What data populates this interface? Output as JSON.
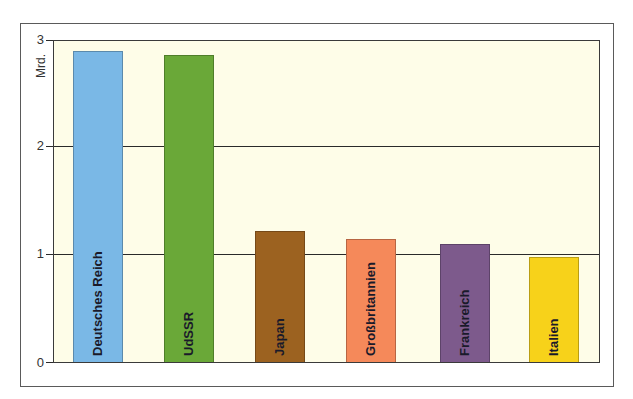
{
  "chart_data": {
    "type": "bar",
    "title": "",
    "xlabel": "",
    "ylabel": "Mrd.",
    "ylim": [
      0,
      3
    ],
    "yticks": [
      0,
      1,
      2,
      3
    ],
    "grid": true,
    "categories": [
      "Deutsches Reich",
      "UdSSR",
      "Japan",
      "Großbritannien",
      "Frankreich",
      "Italien"
    ],
    "values": [
      2.91,
      2.87,
      1.22,
      1.15,
      1.1,
      0.98
    ],
    "colors": [
      "#7ab8e6",
      "#6aa838",
      "#9c6220",
      "#f5895a",
      "#7d5a8c",
      "#f7d21a"
    ],
    "bar_label_position": "inside-vertical"
  },
  "axis": {
    "unit": "Mrd.",
    "ticks": [
      "0",
      "1",
      "2",
      "3"
    ]
  },
  "bars": [
    {
      "label": "Deutsches Reich",
      "value": 2.91,
      "color": "#7ab8e6"
    },
    {
      "label": "UdSSR",
      "value": 2.87,
      "color": "#6aa838"
    },
    {
      "label": "Japan",
      "value": 1.22,
      "color": "#9c6220"
    },
    {
      "label": "Großbritannien",
      "value": 1.15,
      "color": "#f5895a"
    },
    {
      "label": "Frankreich",
      "value": 1.1,
      "color": "#7d5a8c"
    },
    {
      "label": "Italien",
      "value": 0.98,
      "color": "#f7d21a"
    }
  ],
  "style": {
    "plot_background": "#fefde8",
    "frame_color": "#5a5a5a"
  }
}
